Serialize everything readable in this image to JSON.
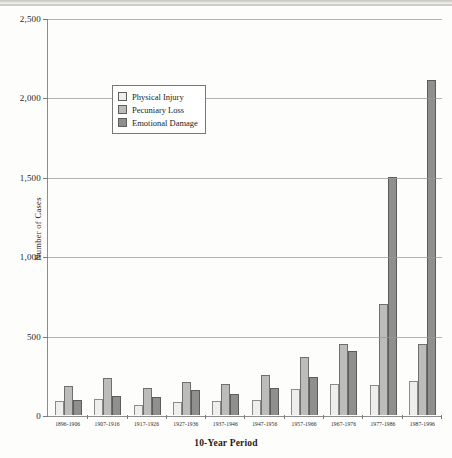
{
  "chart_data": {
    "type": "bar",
    "title": "",
    "xlabel": "10-Year Period",
    "ylabel": "Number of Cases",
    "ylim": [
      0,
      2500
    ],
    "yticks": [
      0,
      500,
      1000,
      1500,
      2000,
      2500
    ],
    "ytick_labels": [
      "0",
      "500",
      "1,000",
      "1,500",
      "2,000",
      "2,500"
    ],
    "grid": true,
    "legend_position": "upper-left-inside",
    "categories": [
      "1896-1906",
      "1907-1916",
      "1917-1926",
      "1927-1936",
      "1937-1946",
      "1947-1956",
      "1957-1966",
      "1967-1976",
      "1977-1986",
      "1987-1996"
    ],
    "series": [
      {
        "name": "Physical Injury",
        "color": "#eeeeec",
        "values": [
          90,
          100,
          60,
          80,
          90,
          95,
          165,
          195,
          190,
          215
        ]
      },
      {
        "name": "Pecuniary Loss",
        "color": "#bcbcba",
        "values": [
          180,
          235,
          170,
          210,
          195,
          255,
          365,
          445,
          700,
          450
        ]
      },
      {
        "name": "Emotional Damage",
        "color": "#8f8f8d",
        "values": [
          95,
          120,
          115,
          155,
          135,
          170,
          240,
          405,
          1500,
          2110
        ]
      }
    ]
  }
}
